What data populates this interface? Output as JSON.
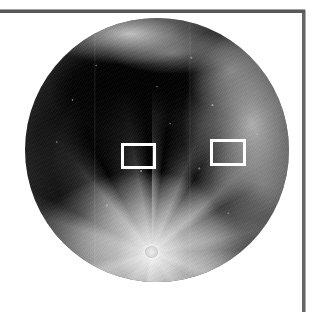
{
  "page": {
    "width": 316,
    "height": 312,
    "background_color": "#ffffff",
    "kind": "scanned-figure-page"
  },
  "rules": [
    {
      "name": "top-rule",
      "orientation": "horizontal",
      "x": 0,
      "y": 10,
      "length": 305,
      "thickness": 3,
      "color": "#4a4a4a"
    },
    {
      "name": "right-rule",
      "orientation": "vertical",
      "x": 302,
      "y": 10,
      "length": 302,
      "thickness": 3,
      "color": "#5a5a5a"
    }
  ],
  "figure": {
    "disc": {
      "center_x": 157,
      "center_y": 154,
      "radius": 132,
      "diameter": 264,
      "left": 25,
      "top": 18,
      "limb_color": "#c8c8c8",
      "maria_color": "#0b0b0b",
      "highland_color": "#d8d8d8"
    },
    "features": [
      {
        "name": "tycho-crater",
        "x_pct": 48,
        "y_pct": 89,
        "brightness": "bright",
        "description": "bright crater with radial ray system"
      },
      {
        "name": "southern-highlands",
        "x_pct": 48,
        "y_pct": 92,
        "brightness": "bright"
      },
      {
        "name": "eastern-highlands",
        "x_pct": 86,
        "y_pct": 40,
        "brightness": "bright"
      },
      {
        "name": "northern-rim",
        "x_pct": 40,
        "y_pct": 6,
        "brightness": "bright"
      },
      {
        "name": "mare-imbrium",
        "x_pct": 34,
        "y_pct": 26,
        "brightness": "dark"
      },
      {
        "name": "mare-serenitatis",
        "x_pct": 57,
        "y_pct": 24,
        "brightness": "dark"
      },
      {
        "name": "oceanus-procellarum",
        "x_pct": 38,
        "y_pct": 50,
        "brightness": "dark"
      },
      {
        "name": "mare-tranquillitatis",
        "x_pct": 62,
        "y_pct": 48,
        "brightness": "dark"
      },
      {
        "name": "mare-fecunditatis",
        "x_pct": 80,
        "y_pct": 52,
        "brightness": "dark"
      },
      {
        "name": "mare-nectaris",
        "x_pct": 84,
        "y_pct": 66,
        "brightness": "dark"
      }
    ]
  },
  "annotations": {
    "stroke_color": "#ffffff",
    "stroke_width": 3,
    "boxes": [
      {
        "label": "roi-left",
        "x": 121,
        "y": 143,
        "width": 35,
        "height": 26
      },
      {
        "label": "roi-right",
        "x": 210,
        "y": 139,
        "width": 36,
        "height": 27
      }
    ]
  }
}
